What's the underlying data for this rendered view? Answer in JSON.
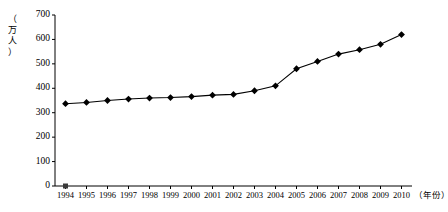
{
  "chart_data": {
    "type": "line",
    "title": "",
    "xlabel": "（年份）",
    "ylabel": "（万人）",
    "ylim": [
      0,
      700
    ],
    "ytick_values": [
      0,
      100,
      200,
      300,
      400,
      500,
      600,
      700
    ],
    "ytick_labels": [
      "0",
      "100",
      "200",
      "300",
      "400",
      "500",
      "600",
      "700"
    ],
    "grid": false,
    "legend": "none",
    "marker": "diamond",
    "line_color": "#000000",
    "marker_color": "#000000",
    "axis_color": "#000000",
    "categories": [
      "1994",
      "1995",
      "1996",
      "1997",
      "1998",
      "1999",
      "2000",
      "2001",
      "2002",
      "2003",
      "2004",
      "2005",
      "2006",
      "2007",
      "2008",
      "2009",
      "2010"
    ],
    "values": [
      337,
      342,
      350,
      356,
      360,
      362,
      366,
      372,
      375,
      390,
      410,
      480,
      510,
      540,
      558,
      580,
      620
    ],
    "series": [
      {
        "name": "人口",
        "values": [
          337,
          342,
          350,
          356,
          360,
          362,
          366,
          372,
          375,
          390,
          410,
          480,
          510,
          540,
          558,
          580,
          620
        ]
      }
    ],
    "origin_marker": {
      "shape": "square",
      "color": "#3a3a3a",
      "at_category": "1994",
      "value": 0
    }
  },
  "axes": {
    "y_unit_chars": [
      "（",
      "万",
      "人",
      "）"
    ],
    "x_unit_label": "（年份）"
  }
}
